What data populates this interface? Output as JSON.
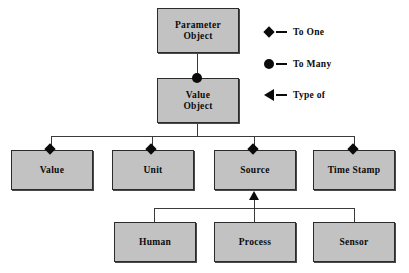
{
  "diagram": {
    "type": "entity-relationship-diagram",
    "background_color": "#ffffff",
    "box_fill_color": "#c2c2c2",
    "box_border_color": "#2b2b2b",
    "line_color": "#3a3a3a",
    "marker_color": "#0b0b0b"
  },
  "nodes": [
    {
      "id": "parameter-object",
      "label": "Parameter\nObject",
      "x": 157,
      "y": 8,
      "w": 82,
      "h": 45
    },
    {
      "id": "value-object",
      "label": "Value\nObject",
      "x": 157,
      "y": 78,
      "w": 82,
      "h": 45
    },
    {
      "id": "value",
      "label": "Value",
      "x": 11,
      "y": 150,
      "w": 82,
      "h": 40
    },
    {
      "id": "unit",
      "label": "Unit",
      "x": 112,
      "y": 150,
      "w": 82,
      "h": 40
    },
    {
      "id": "source",
      "label": "Source",
      "x": 214,
      "y": 150,
      "w": 82,
      "h": 40
    },
    {
      "id": "time-stamp",
      "label": "Time Stamp",
      "x": 313,
      "y": 150,
      "w": 82,
      "h": 40
    },
    {
      "id": "human",
      "label": "Human",
      "x": 114,
      "y": 222,
      "w": 82,
      "h": 40
    },
    {
      "id": "process",
      "label": "Process",
      "x": 214,
      "y": 222,
      "w": 82,
      "h": 40
    },
    {
      "id": "sensor",
      "label": "Sensor",
      "x": 313,
      "y": 222,
      "w": 82,
      "h": 40
    }
  ],
  "relationships": [
    {
      "from": "parameter-object",
      "to": "value-object",
      "kind": "to-many"
    },
    {
      "from": "value-object",
      "to": "value",
      "kind": "to-one"
    },
    {
      "from": "value-object",
      "to": "unit",
      "kind": "to-one"
    },
    {
      "from": "value-object",
      "to": "source",
      "kind": "to-one"
    },
    {
      "from": "value-object",
      "to": "time-stamp",
      "kind": "to-one"
    },
    {
      "from": "human",
      "to": "source",
      "kind": "type-of"
    },
    {
      "from": "process",
      "to": "source",
      "kind": "type-of"
    },
    {
      "from": "sensor",
      "to": "source",
      "kind": "type-of"
    }
  ],
  "legend": {
    "items": [
      {
        "symbol": "diamond-marker",
        "label": "To One"
      },
      {
        "symbol": "circle-marker",
        "label": "To Many"
      },
      {
        "symbol": "triangle-left-marker",
        "label": "Type of"
      }
    ]
  }
}
